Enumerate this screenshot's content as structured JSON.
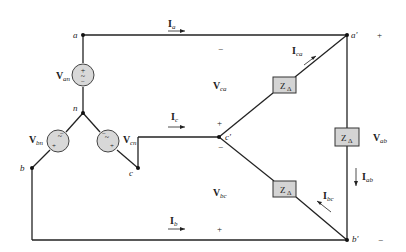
{
  "diagram": {
    "type": "three-phase wye-delta circuit",
    "nodes": {
      "a": "a",
      "b": "b",
      "c": "c",
      "n": "n",
      "a_prime": "a′",
      "b_prime": "b′",
      "c_prime": "c′"
    },
    "sources": [
      {
        "name": "V",
        "sub": "an"
      },
      {
        "name": "V",
        "sub": "bn"
      },
      {
        "name": "V",
        "sub": "cn"
      }
    ],
    "line_currents": [
      {
        "name": "I",
        "sub": "a"
      },
      {
        "name": "I",
        "sub": "b"
      },
      {
        "name": "I",
        "sub": "c"
      }
    ],
    "phase_currents": [
      {
        "name": "I",
        "sub": "ca"
      },
      {
        "name": "I",
        "sub": "ab"
      },
      {
        "name": "I",
        "sub": "bc"
      }
    ],
    "line_voltages": [
      {
        "name": "V",
        "sub": "ca"
      },
      {
        "name": "V",
        "sub": "ab"
      },
      {
        "name": "V",
        "sub": "bc"
      }
    ],
    "impedance": {
      "name": "Z",
      "sub": "Δ"
    },
    "polarity": {
      "plus": "+",
      "minus": "−"
    },
    "colors": {
      "wire": "#222222",
      "box_fill": "#d4d4d4",
      "source_fill": "#d8d8d8"
    }
  }
}
